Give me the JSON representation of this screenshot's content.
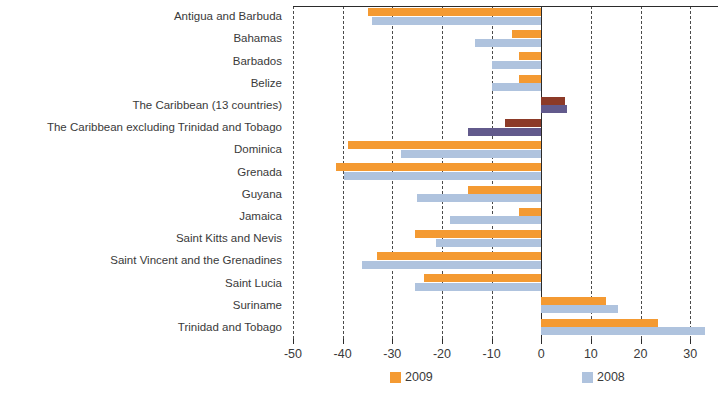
{
  "chart_data": {
    "type": "bar",
    "orientation": "horizontal",
    "title": "",
    "subtitle": "",
    "xlabel": "",
    "ylabel": "",
    "xlim": [
      -50,
      34
    ],
    "xticks": [
      -50,
      -40,
      -30,
      -20,
      -10,
      0,
      10,
      20,
      30
    ],
    "xtick_labels": [
      "-50",
      "-40",
      "-30",
      "-20",
      "-10",
      "0",
      "10",
      "20",
      "30"
    ],
    "grid": "vertical-dashed",
    "legend_position": "bottom",
    "categories": [
      "Antigua and Barbuda",
      "Bahamas",
      "Barbados",
      "Belize",
      "The Caribbean (13 countries)",
      "The Caribbean excluding Trinidad and Tobago",
      "Dominica",
      "Grenada",
      "Guyana",
      "Jamaica",
      "Saint Kitts and Nevis",
      "Saint Vincent and the Grenadines",
      "Saint Lucia",
      "Suriname",
      "Trinidad and Tobago"
    ],
    "aggregate_rows": [
      4,
      5
    ],
    "series": [
      {
        "name": "2009",
        "color": "#F49A32",
        "color_aggregate": "#8C3A28",
        "values": [
          -34.8,
          -5.8,
          -4.4,
          -4.4,
          4.8,
          -7.3,
          -39.0,
          -41.3,
          -14.8,
          -4.4,
          -25.4,
          -33.0,
          -23.7,
          13.0,
          23.5
        ]
      },
      {
        "name": "2008",
        "color": "#AFC3DE",
        "color_aggregate": "#625A8C",
        "values": [
          -34.0,
          -13.3,
          -10.0,
          -10.0,
          5.2,
          -14.8,
          -28.3,
          -39.8,
          -25.0,
          -18.3,
          -21.2,
          -36.2,
          -25.4,
          15.4,
          33.0
        ]
      }
    ]
  },
  "legend": {
    "items": [
      {
        "label": "2009"
      },
      {
        "label": "2008"
      }
    ]
  }
}
